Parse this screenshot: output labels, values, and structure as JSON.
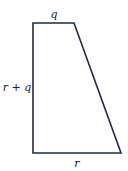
{
  "diagram": {
    "shape": "trapezoid",
    "stroke_color": "#1f2a44",
    "labels": {
      "top": "q",
      "left": "r + q",
      "bottom": "r"
    }
  }
}
